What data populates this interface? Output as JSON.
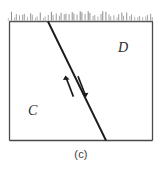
{
  "figure": {
    "caption": "(c)",
    "blocks": [
      {
        "id": "C",
        "label": "C",
        "position": "lower-left"
      },
      {
        "id": "D",
        "label": "D",
        "position": "upper-right"
      }
    ],
    "surface": {
      "name": "ground-surface-hatching",
      "tick_count": 56,
      "color": "#8a8a8a"
    },
    "fault": {
      "name": "fault-line",
      "color": "#1a1a1a",
      "x_top": 48,
      "y_top": 21,
      "x_bottom": 106,
      "y_bottom": 141
    },
    "slip_arrows": [
      {
        "name": "slip-arrow-up",
        "direction": "up-left",
        "side": "hanging-wall"
      },
      {
        "name": "slip-arrow-down",
        "direction": "down-right",
        "side": "footwall"
      }
    ],
    "frame": {
      "color": "#4a4a4a",
      "left": 9,
      "top": 21,
      "right": 153,
      "bottom": 141
    }
  },
  "chart_data": {
    "type": "diagram",
    "title": "(c)",
    "subtitle": "",
    "xlabel": "",
    "ylabel": "",
    "annotations": [
      "C",
      "D",
      "(c)"
    ],
    "legend": [],
    "series": [
      {
        "name": "fault-trace",
        "x": [
          48,
          106
        ],
        "y": [
          21,
          141
        ]
      }
    ]
  }
}
